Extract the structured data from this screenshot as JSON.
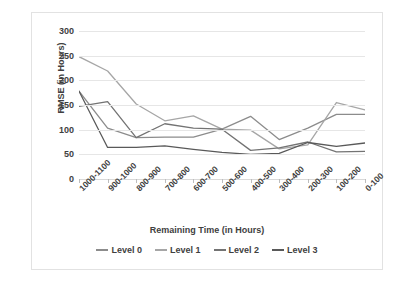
{
  "chart_data": {
    "type": "line",
    "title": "",
    "xlabel": "Remaining Time (in Hours)",
    "ylabel": "RMSE (in Hours)",
    "ylim": [
      0,
      300
    ],
    "yticks": [
      0,
      50,
      100,
      150,
      200,
      250,
      300
    ],
    "grid": true,
    "legend_position": "bottom",
    "categories": [
      "1000-1100",
      "900-1000",
      "800-900",
      "700-800",
      "600-700",
      "500-600",
      "400-500",
      "300-400",
      "200-300",
      "100-200",
      "0-100"
    ],
    "series": [
      {
        "name": "Level 0",
        "color": "#8c8c8c",
        "values": [
          178,
          103,
          84,
          85,
          85,
          101,
          127,
          80,
          103,
          131,
          131
        ]
      },
      {
        "name": "Level 1",
        "color": "#a6a6a6",
        "values": [
          248,
          219,
          152,
          118,
          128,
          101,
          99,
          61,
          69,
          155,
          140
        ]
      },
      {
        "name": "Level 2",
        "color": "#737373",
        "values": [
          147,
          157,
          84,
          112,
          103,
          101,
          58,
          63,
          75,
          55,
          56
        ]
      },
      {
        "name": "Level 3",
        "color": "#595959",
        "values": [
          178,
          64,
          64,
          67,
          60,
          54,
          50,
          52,
          74,
          66,
          73
        ]
      }
    ]
  },
  "legend": {
    "items": [
      {
        "label": "Level 0"
      },
      {
        "label": "Level 1"
      },
      {
        "label": "Level 2"
      },
      {
        "label": "Level 3"
      }
    ]
  },
  "axes": {
    "y_title": "RMSE (in Hours)",
    "x_title": "Remaining Time (in Hours)",
    "y_tick_labels": [
      "300",
      "250",
      "200",
      "150",
      "100",
      "50",
      "0"
    ],
    "x_tick_labels": [
      "1000-1100",
      "900-1000",
      "800-900",
      "700-800",
      "600-700",
      "500-600",
      "400-500",
      "300-400",
      "200-300",
      "100-200",
      "0-100"
    ]
  },
  "colors": {
    "gridline": "#e6e6e6",
    "frame": "#e2e2e2",
    "text": "#3f3f3f"
  }
}
